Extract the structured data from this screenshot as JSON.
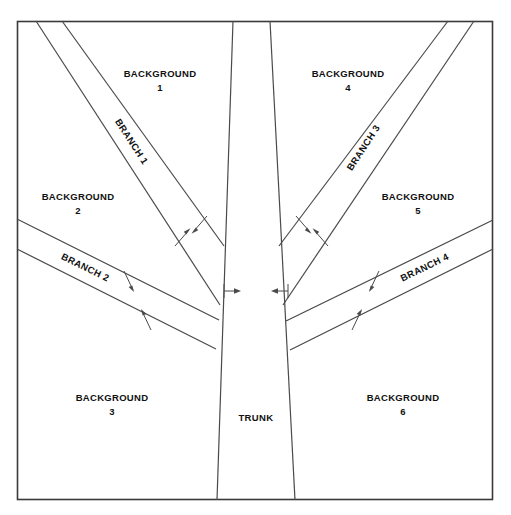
{
  "figure": {
    "background_color": "#ffffff",
    "line_color": "#4a4a4a",
    "frame_color": "#3a3a3a",
    "text_color": "#111111",
    "frame": {
      "x": 17,
      "y": 21,
      "width": 476,
      "height": 479
    }
  },
  "labels": {
    "trunk": "TRUNK",
    "background_1_line1": "BACKGROUND",
    "background_1_line2": "1",
    "background_2_line1": "BACKGROUND",
    "background_2_line2": "2",
    "background_3_line1": "BACKGROUND",
    "background_3_line2": "3",
    "background_4_line1": "BACKGROUND",
    "background_4_line2": "4",
    "background_5_line1": "BACKGROUND",
    "background_5_line2": "5",
    "background_6_line1": "BACKGROUND",
    "background_6_line2": "6",
    "branch_1": "BRANCH 1",
    "branch_2": "BRANCH 2",
    "branch_3": "BRANCH 3",
    "branch_4": "BRANCH 4"
  },
  "regions": [
    {
      "id": "background-1",
      "name": "BACKGROUND",
      "index": "1",
      "x": 160,
      "y": 74,
      "quadrant": "top-left"
    },
    {
      "id": "background-2",
      "name": "BACKGROUND",
      "index": "2",
      "x": 78,
      "y": 197,
      "quadrant": "mid-left"
    },
    {
      "id": "background-3",
      "name": "BACKGROUND",
      "index": "3",
      "x": 112,
      "y": 398,
      "quadrant": "bottom-left"
    },
    {
      "id": "background-4",
      "name": "BACKGROUND",
      "index": "4",
      "x": 348,
      "y": 74,
      "quadrant": "top-right"
    },
    {
      "id": "background-5",
      "name": "BACKGROUND",
      "index": "5",
      "x": 418,
      "y": 197,
      "quadrant": "mid-right"
    },
    {
      "id": "background-6",
      "name": "BACKGROUND",
      "index": "6",
      "x": 403,
      "y": 398,
      "quadrant": "bottom-right"
    },
    {
      "id": "trunk",
      "name": "TRUNK",
      "index": "",
      "x": 256,
      "y": 418,
      "quadrant": "center-bottom"
    }
  ],
  "branches": [
    {
      "id": "branch-1",
      "label": "BRANCH 1",
      "side": "left",
      "angle_deg": 57,
      "label_x": 131,
      "label_y": 142
    },
    {
      "id": "branch-2",
      "label": "BRANCH 2",
      "side": "left",
      "angle_deg": 23,
      "label_x": 85,
      "label_y": 268
    },
    {
      "id": "branch-3",
      "label": "BRANCH 3",
      "side": "right",
      "angle_deg": -57,
      "label_x": 364,
      "label_y": 148
    },
    {
      "id": "branch-4",
      "label": "BRANCH 4",
      "side": "right",
      "angle_deg": -23,
      "label_x": 425,
      "label_y": 268
    }
  ],
  "annotations": {
    "trunk_width_arrows": 2,
    "branch_width_arrows": 8,
    "arrow_y_trunk": 291
  }
}
